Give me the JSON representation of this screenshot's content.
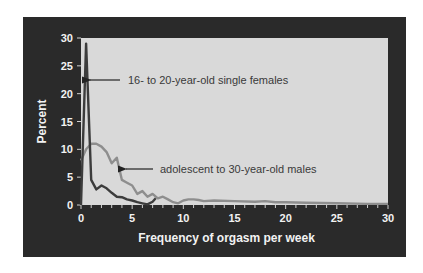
{
  "chart_data": {
    "type": "line",
    "title": "",
    "xlabel": "Frequency of orgasm per week",
    "ylabel": "Percent",
    "xlim": [
      0,
      30
    ],
    "ylim": [
      0,
      30
    ],
    "xticks": [
      0,
      5,
      10,
      15,
      20,
      25,
      30
    ],
    "yticks": [
      0,
      5,
      10,
      15,
      20,
      25,
      30
    ],
    "grid": false,
    "legend": "inline annotations with arrows",
    "colors": {
      "panel_background": "#2a2a2a",
      "plot_background": "#d9d9d9",
      "females_line": "#3c3c3c",
      "males_line": "#8e8e8e"
    },
    "series": [
      {
        "name": "16- to 20-year-old single females",
        "points": [
          [
            0,
            0
          ],
          [
            0.5,
            29
          ],
          [
            1,
            4.5
          ],
          [
            1.5,
            2.8
          ],
          [
            2,
            3.5
          ],
          [
            2.5,
            3
          ],
          [
            3,
            2.2
          ],
          [
            3.5,
            1.5
          ],
          [
            4,
            1.4
          ],
          [
            4.5,
            1.0
          ],
          [
            5,
            0.8
          ],
          [
            5.5,
            0.5
          ],
          [
            6,
            0.3
          ],
          [
            6.5,
            0.1
          ],
          [
            7,
            0.6
          ],
          [
            7.3,
            1.2
          ]
        ]
      },
      {
        "name": "adolescent to 30-year-old males",
        "points": [
          [
            0,
            8
          ],
          [
            0.5,
            10
          ],
          [
            1,
            11
          ],
          [
            1.5,
            11
          ],
          [
            2,
            10.5
          ],
          [
            2.5,
            9.5
          ],
          [
            3,
            7.5
          ],
          [
            3.5,
            8.5
          ],
          [
            4,
            4.5
          ],
          [
            4.5,
            4
          ],
          [
            5,
            3.5
          ],
          [
            5.5,
            2
          ],
          [
            6,
            2.5
          ],
          [
            6.5,
            1.5
          ],
          [
            7,
            2
          ],
          [
            7.5,
            1.2
          ],
          [
            8,
            1.5
          ],
          [
            8.5,
            1
          ],
          [
            9,
            0.5
          ],
          [
            9.5,
            0.3
          ],
          [
            10,
            0.8
          ],
          [
            10.5,
            1
          ],
          [
            11,
            1
          ],
          [
            11.5,
            0.9
          ],
          [
            12,
            0.7
          ],
          [
            13,
            0.8
          ],
          [
            15,
            0.7
          ],
          [
            17,
            0.6
          ],
          [
            18,
            0.7
          ],
          [
            19,
            0.5
          ],
          [
            20,
            0.5
          ],
          [
            22,
            0.4
          ],
          [
            25,
            0.3
          ],
          [
            28,
            0.2
          ],
          [
            30,
            0.2
          ]
        ]
      }
    ],
    "annotations": [
      {
        "text": "16- to 20-year-old single females",
        "arrow_to": [
          0.7,
          25
        ]
      },
      {
        "text": "adolescent to 30-year-old males",
        "arrow_to": [
          4.3,
          6
        ]
      }
    ]
  }
}
